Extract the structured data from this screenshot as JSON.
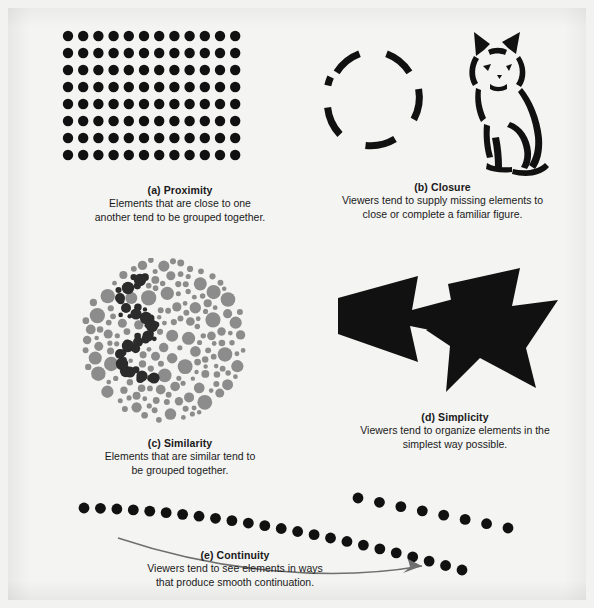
{
  "figure": {
    "background_color": "#f4f4f2",
    "ink_color": "#111111",
    "gray_color": "#8c8c8c"
  },
  "panels": [
    {
      "id": "proximity",
      "label": "(a) Proximity",
      "lines": [
        "Elements that are close to one",
        "another tend to be grouped together."
      ],
      "art": "dot-grid"
    },
    {
      "id": "closure",
      "label": "(b) Closure",
      "lines": [
        "Viewers tend to supply missing elements to",
        "close or complete a familiar figure."
      ],
      "art": "broken-circle-and-cat"
    },
    {
      "id": "similarity",
      "label": "(c) Similarity",
      "lines": [
        "Elements that are similar tend to",
        "be grouped together."
      ],
      "art": "dot-cloud"
    },
    {
      "id": "simplicity",
      "label": "(d) Simplicity",
      "lines": [
        "Viewers tend to organize elements in the",
        "simplest way possible."
      ],
      "art": "overlapping-arrows"
    },
    {
      "id": "continuity",
      "label": "(e) Continuity",
      "lines": [
        "Viewers tend to see elements in ways",
        "that produce smooth continuation."
      ],
      "art": "dot-curves-with-arrow"
    }
  ],
  "chart_data": {
    "type": "diagram",
    "items": [
      {
        "key": "a",
        "name": "Proximity",
        "description": "Elements that are close to one another tend to be grouped together."
      },
      {
        "key": "b",
        "name": "Closure",
        "description": "Viewers tend to supply missing elements to close or complete a familiar figure."
      },
      {
        "key": "c",
        "name": "Similarity",
        "description": "Elements that are similar tend to be grouped together."
      },
      {
        "key": "d",
        "name": "Simplicity",
        "description": "Viewers tend to organize elements in the simplest way possible."
      },
      {
        "key": "e",
        "name": "Continuity",
        "description": "Viewers tend to see elements in ways that produce smooth continuation."
      }
    ],
    "proximity_grid": {
      "columns": 12,
      "rows": 8,
      "dot_radius": 5.2,
      "col_spacing": 15.2,
      "row_spacing": 17.0
    },
    "continuity_curves": {
      "main_dots": 24,
      "branch_dots": 8
    }
  }
}
